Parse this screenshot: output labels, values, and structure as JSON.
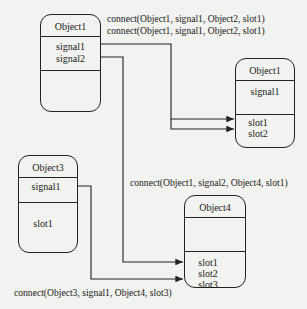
{
  "objects": {
    "object1": {
      "title": "Object1",
      "signals": [
        "signal1",
        "signal2"
      ],
      "slots": []
    },
    "object2": {
      "title": "Object1",
      "signals": [
        "signal1"
      ],
      "slots": [
        "slot1",
        "slot2"
      ]
    },
    "object3": {
      "title": "Object3",
      "signals": [
        "signal1"
      ],
      "slots": [
        "slot1"
      ]
    },
    "object4": {
      "title": "Object4",
      "signals": [],
      "slots": [
        "slot1",
        "slot2",
        "slot3"
      ]
    }
  },
  "connections": [
    {
      "label": "connect(Object1, signal1, Object2, slot1)",
      "from": "Object1.signal1",
      "to": "Object2.slot1"
    },
    {
      "label": "connect(Object1, signal1, Object2, slot1)",
      "from": "Object1.signal1",
      "to": "Object2.slot2"
    },
    {
      "label": "connect(Object1, signal2, Object4, slot1)",
      "from": "Object1.signal2",
      "to": "Object4.slot1"
    },
    {
      "label": "connect(Object3, signal1, Object4, slot3)",
      "from": "Object3.signal1",
      "to": "Object4.slot3"
    }
  ],
  "colors": {
    "line": "#222222",
    "background": "#f2f2f0"
  }
}
